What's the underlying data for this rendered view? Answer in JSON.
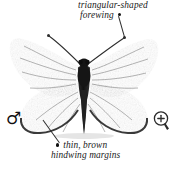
{
  "figure": {
    "sex_symbol": "♂",
    "background_color": "#ffffff",
    "wing_color": "#6e6e6e",
    "wing_margin_color": "#3a3a3a",
    "body_color": "#1c1c1c"
  },
  "annotations": {
    "top": {
      "line1": "triangular-shaped",
      "line2": "forewing",
      "bullet_position": "after"
    },
    "bottom": {
      "line1": "thin, brown",
      "line2": "hindwing margins",
      "bullet_position": "before"
    }
  },
  "icons": {
    "zoom_in": "zoom-in-magnifier",
    "zoom_in_glyph": "+"
  }
}
